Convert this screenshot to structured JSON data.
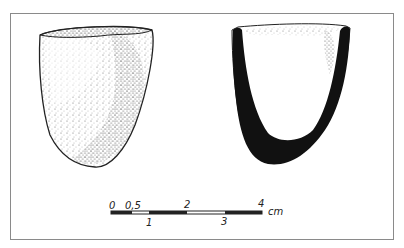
{
  "figure": {
    "views": [
      {
        "name": "exterior-view"
      },
      {
        "name": "section-view"
      }
    ]
  },
  "scale_bar": {
    "unit": "cm",
    "top_labels": [
      "0",
      "0,5",
      "2",
      "4"
    ],
    "bottom_labels": [
      "1",
      "3"
    ]
  }
}
